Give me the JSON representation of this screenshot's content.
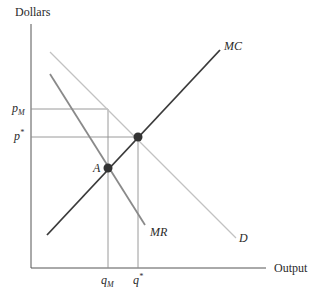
{
  "diagram": {
    "y_axis_label": "Dollars",
    "x_axis_label": "Output",
    "curves": {
      "mc": {
        "label": "MC",
        "color": "#3a3a3a"
      },
      "mr": {
        "label": "MR",
        "color": "#8a8a8a"
      },
      "d": {
        "label": "D",
        "color": "#bdbdbd"
      }
    },
    "points": {
      "a": {
        "label": "A"
      }
    },
    "y_ticks": {
      "p_m": {
        "base": "p",
        "sub": "M"
      },
      "p_star": {
        "base": "p",
        "sup": "*"
      }
    },
    "x_ticks": {
      "q_m": {
        "base": "q",
        "sub": "M"
      },
      "q_star": {
        "base": "q",
        "sup": "*"
      }
    },
    "colors": {
      "axis": "#555555",
      "guide": "#9a9a9a",
      "dot": "#333333"
    }
  }
}
